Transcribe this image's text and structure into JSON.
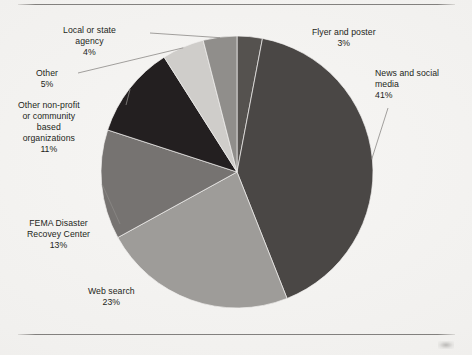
{
  "page": {
    "background_color": "#f2f1ef",
    "rule_color": "#6f6d6b",
    "has_top_rule": true,
    "has_bottom_rule": true
  },
  "chart_data": {
    "type": "pie",
    "title": "",
    "legend_position": "none",
    "labels_outside": true,
    "start_angle_deg": 0,
    "direction": "clockwise",
    "center": {
      "x": 237,
      "y": 172
    },
    "radius": 136,
    "categories": [
      "Flyer and poster",
      "News and social media",
      "Web search",
      "FEMA Disaster Recovey Center",
      "Other non-profit or community based organizations",
      "Other",
      "Local or state agency"
    ],
    "values": [
      3,
      41,
      23,
      13,
      11,
      5,
      4
    ],
    "total": 100,
    "unit": "%",
    "slices": [
      {
        "name": "Flyer and poster",
        "value": 3,
        "pct_text": "3%",
        "color": "#55524f",
        "label_lines": [
          "Flyer and poster"
        ],
        "label_left_px": 312,
        "label_top_px": 27,
        "leader": false
      },
      {
        "name": "News and social media",
        "value": 41,
        "pct_text": "41%",
        "color": "#4a4745",
        "label_lines": [
          "News and social",
          "media"
        ],
        "label_left_px": 375,
        "label_top_px": 68,
        "leader": true
      },
      {
        "name": "Web search",
        "value": 23,
        "pct_text": "23%",
        "color": "#9e9c99",
        "label_lines": [
          "Web search"
        ],
        "label_left_px": 88,
        "label_top_px": 286,
        "leader": false
      },
      {
        "name": "FEMA Disaster Recovey Center",
        "value": 13,
        "pct_text": "13%",
        "color": "#767371",
        "label_lines": [
          "FEMA Disaster",
          "Recovey Center"
        ],
        "label_left_px": 27,
        "label_top_px": 218,
        "leader": true
      },
      {
        "name": "Other non-profit or community based organizations",
        "value": 11,
        "pct_text": "11%",
        "color": "#231f20",
        "label_lines": [
          "Other non-profit",
          "or community",
          "based",
          "organizations"
        ],
        "label_left_px": 18,
        "label_top_px": 100,
        "leader": true
      },
      {
        "name": "Other",
        "value": 5,
        "pct_text": "5%",
        "color": "#cfcdca",
        "label_lines": [
          "Other"
        ],
        "label_left_px": 36,
        "label_top_px": 68,
        "leader": true
      },
      {
        "name": "Local or state agency",
        "value": 4,
        "pct_text": "4%",
        "color": "#908e8b",
        "label_lines": [
          "Local or state",
          "agency"
        ],
        "label_left_px": 63,
        "label_top_px": 25,
        "leader": true
      }
    ]
  }
}
